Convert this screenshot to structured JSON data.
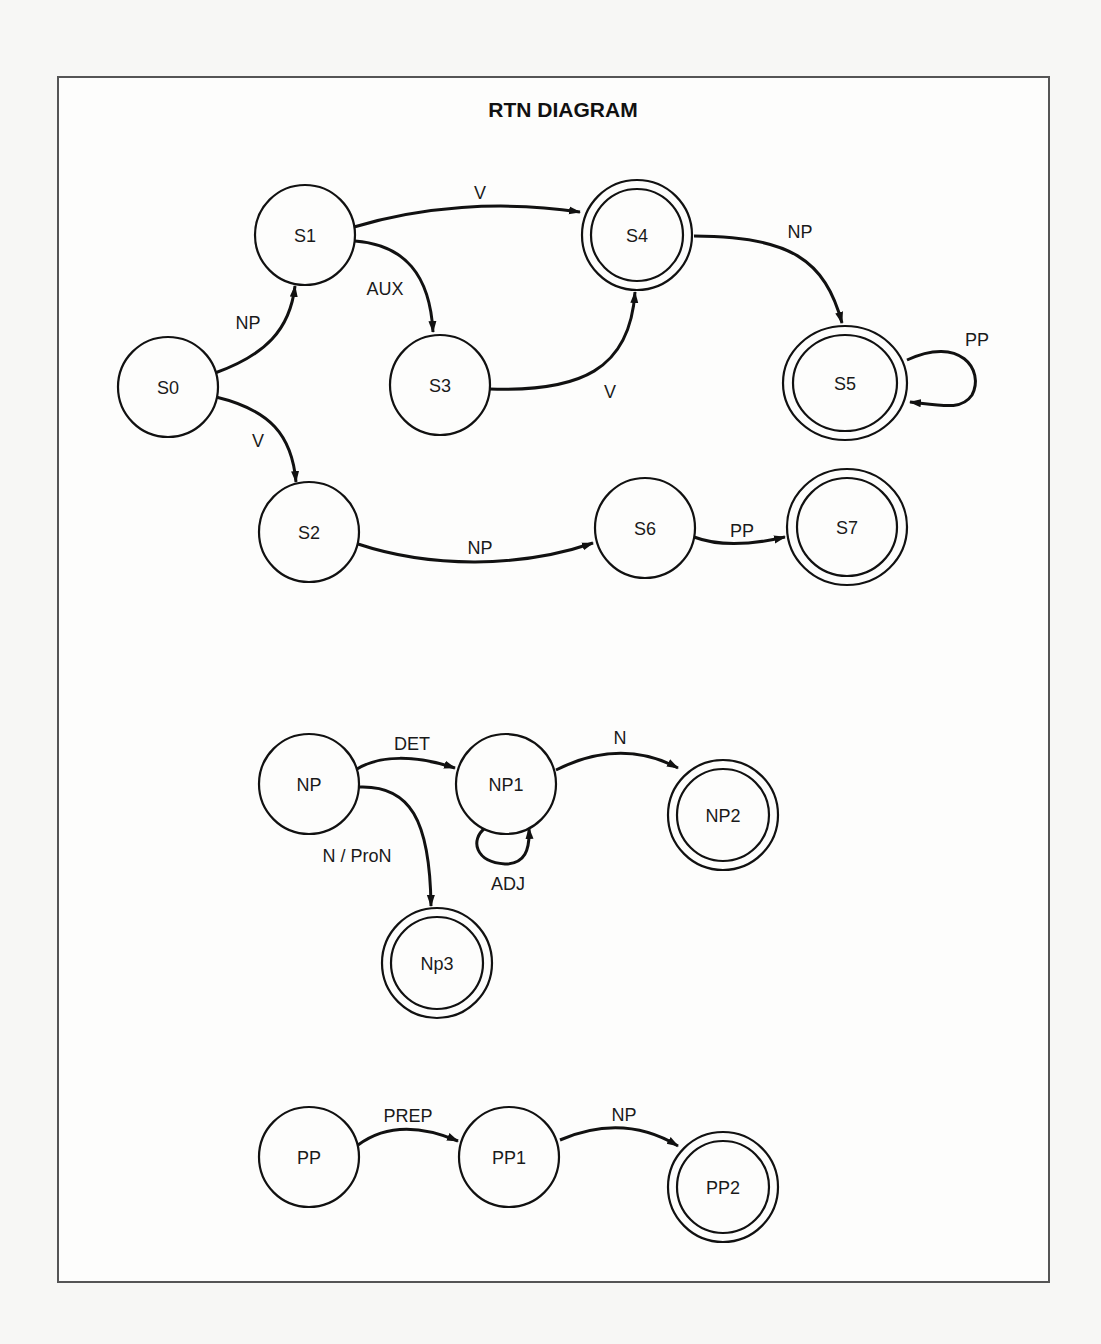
{
  "title": "RTN DIAGRAM",
  "networks": [
    {
      "name": "S",
      "nodes": [
        {
          "id": "S0",
          "label": "S0",
          "x": 168,
          "y": 387,
          "rx": 50,
          "ry": 50,
          "final": false
        },
        {
          "id": "S1",
          "label": "S1",
          "x": 305,
          "y": 235,
          "rx": 50,
          "ry": 50,
          "final": false
        },
        {
          "id": "S2",
          "label": "S2",
          "x": 309,
          "y": 532,
          "rx": 50,
          "ry": 50,
          "final": false
        },
        {
          "id": "S3",
          "label": "S3",
          "x": 440,
          "y": 385,
          "rx": 50,
          "ry": 50,
          "final": false
        },
        {
          "id": "S4",
          "label": "S4",
          "x": 637,
          "y": 235,
          "rx": 55,
          "ry": 55,
          "final": true
        },
        {
          "id": "S5",
          "label": "S5",
          "x": 845,
          "y": 383,
          "rx": 62,
          "ry": 57,
          "final": true
        },
        {
          "id": "S6",
          "label": "S6",
          "x": 645,
          "y": 528,
          "rx": 50,
          "ry": 50,
          "final": false
        },
        {
          "id": "S7",
          "label": "S7",
          "x": 847,
          "y": 527,
          "rx": 60,
          "ry": 58,
          "final": true
        }
      ],
      "edges": [
        {
          "from": "S0",
          "to": "S1",
          "label": "NP",
          "label_x": 248,
          "label_y": 327
        },
        {
          "from": "S0",
          "to": "S2",
          "label": "V",
          "label_x": 258,
          "label_y": 447
        },
        {
          "from": "S1",
          "to": "S4",
          "label": "V",
          "label_x": 480,
          "label_y": 197
        },
        {
          "from": "S1",
          "to": "S3",
          "label": "AUX",
          "label_x": 385,
          "label_y": 293
        },
        {
          "from": "S3",
          "to": "S4",
          "label": "V",
          "label_x": 610,
          "label_y": 398
        },
        {
          "from": "S4",
          "to": "S5",
          "label": "NP",
          "label_x": 800,
          "label_y": 236
        },
        {
          "from": "S5",
          "to": "S5",
          "label": "PP",
          "label_x": 977,
          "label_y": 375
        },
        {
          "from": "S2",
          "to": "S6",
          "label": "NP",
          "label_x": 480,
          "label_y": 556
        },
        {
          "from": "S6",
          "to": "S7",
          "label": "PP",
          "label_x": 742,
          "label_y": 535
        }
      ]
    },
    {
      "name": "NP",
      "nodes": [
        {
          "id": "NP",
          "label": "NP",
          "x": 309,
          "y": 784,
          "rx": 50,
          "ry": 50,
          "final": false
        },
        {
          "id": "NP1",
          "label": "NP1",
          "x": 506,
          "y": 784,
          "rx": 50,
          "ry": 50,
          "final": false
        },
        {
          "id": "NP2",
          "label": "NP2",
          "x": 723,
          "y": 815,
          "rx": 55,
          "ry": 55,
          "final": true
        },
        {
          "id": "Np3",
          "label": "Np3",
          "x": 437,
          "y": 963,
          "rx": 55,
          "ry": 55,
          "final": true
        }
      ],
      "edges": [
        {
          "from": "NP",
          "to": "NP1",
          "label": "DET",
          "label_x": 412,
          "label_y": 748
        },
        {
          "from": "NP",
          "to": "Np3",
          "label": "N / ProN",
          "label_x": 357,
          "label_y": 862
        },
        {
          "from": "NP1",
          "to": "NP1",
          "label": "ADJ",
          "label_x": 508,
          "label_y": 893
        },
        {
          "from": "NP1",
          "to": "NP2",
          "label": "N",
          "label_x": 620,
          "label_y": 742
        }
      ]
    },
    {
      "name": "PP",
      "nodes": [
        {
          "id": "PP",
          "label": "PP",
          "x": 309,
          "y": 1157,
          "rx": 50,
          "ry": 50,
          "final": false
        },
        {
          "id": "PP1",
          "label": "PP1",
          "x": 509,
          "y": 1157,
          "rx": 50,
          "ry": 50,
          "final": false
        },
        {
          "id": "PP2",
          "label": "PP2",
          "x": 723,
          "y": 1187,
          "rx": 55,
          "ry": 55,
          "final": true
        }
      ],
      "edges": [
        {
          "from": "PP",
          "to": "PP1",
          "label": "PREP",
          "label_x": 408,
          "label_y": 1122
        },
        {
          "from": "PP1",
          "to": "PP2",
          "label": "NP",
          "label_x": 624,
          "label_y": 1120
        }
      ]
    }
  ]
}
